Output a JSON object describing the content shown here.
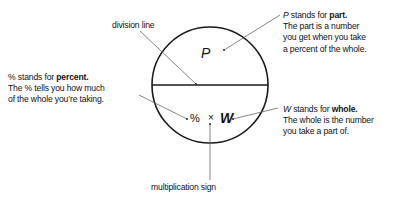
{
  "figure": {
    "type": "percent-circle-diagram",
    "stroke_color": "#1a1a1a",
    "leader_color": "#555555",
    "text_color": "#111111",
    "background": "#ffffff"
  },
  "circle": {
    "center_x": 210,
    "center_y": 85,
    "radius": 58,
    "division_line_label": "division line"
  },
  "formula": {
    "part_symbol": "P",
    "percent_symbol": "%",
    "multiplication_symbol": "×",
    "whole_symbol": "W",
    "multiplication_caption": "multiplication sign"
  },
  "annotations": {
    "part": {
      "symbol": "P",
      "lead": "stands for",
      "term": "part.",
      "lines": [
        "The part is a number",
        "you get when you take",
        "a percent of the whole."
      ]
    },
    "percent": {
      "symbol": "%",
      "lead": "stands for",
      "term": "percent.",
      "lines": [
        "The % tells you how much",
        "of the whole you’re taking."
      ]
    },
    "whole": {
      "symbol": "W",
      "lead": "stands for",
      "term": "whole.",
      "lines": [
        "The whole is the number",
        "you take a part of."
      ]
    }
  }
}
